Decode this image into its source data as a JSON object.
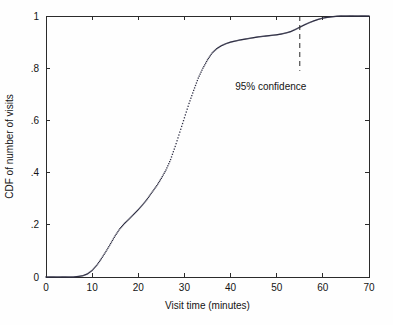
{
  "chart_data": {
    "type": "line",
    "render_style": "dotted-markers",
    "title": "",
    "subtitle": "",
    "xlabel": "Visit time (minutes)",
    "ylabel": "CDF of number of visits",
    "xlim": [
      0,
      70
    ],
    "ylim": [
      0,
      1
    ],
    "grid": false,
    "legend": null,
    "legend_position": "none",
    "xticks": [
      0,
      10,
      20,
      30,
      40,
      50,
      60,
      70
    ],
    "xtick_labels": [
      "0",
      "10",
      "20",
      "30",
      "40",
      "50",
      "60",
      "70"
    ],
    "yticks": [
      0,
      0.2,
      0.4,
      0.6,
      0.8,
      1
    ],
    "ytick_labels": [
      "0",
      ".2",
      ".4",
      ".6",
      ".8",
      "1"
    ],
    "series": [
      {
        "name": "CDF of number of visits",
        "x": [
          0,
          1,
          2,
          3,
          4,
          5,
          6,
          7,
          8,
          9,
          10,
          11,
          12,
          13,
          14,
          15,
          16,
          17,
          18,
          19,
          20,
          21,
          22,
          23,
          24,
          25,
          26,
          27,
          28,
          29,
          30,
          31,
          32,
          33,
          34,
          35,
          36,
          37,
          38,
          39,
          40,
          41,
          42,
          43,
          44,
          45,
          46,
          47,
          48,
          49,
          50,
          51,
          52,
          53,
          54,
          55,
          56,
          57,
          58,
          59,
          60,
          61,
          62,
          63,
          64,
          65,
          66,
          67,
          68,
          69,
          70
        ],
        "y": [
          0.0,
          0.0,
          0.0,
          0.0,
          0.0,
          0.0,
          0.0,
          0.002,
          0.005,
          0.012,
          0.025,
          0.045,
          0.07,
          0.098,
          0.128,
          0.158,
          0.185,
          0.205,
          0.222,
          0.24,
          0.258,
          0.278,
          0.3,
          0.325,
          0.35,
          0.378,
          0.41,
          0.45,
          0.5,
          0.555,
          0.61,
          0.665,
          0.715,
          0.762,
          0.8,
          0.832,
          0.858,
          0.875,
          0.886,
          0.894,
          0.9,
          0.904,
          0.908,
          0.911,
          0.914,
          0.917,
          0.92,
          0.922,
          0.924,
          0.926,
          0.928,
          0.931,
          0.935,
          0.94,
          0.948,
          0.957,
          0.966,
          0.974,
          0.981,
          0.987,
          0.992,
          0.995,
          0.997,
          0.999,
          1.0,
          1.0,
          1.0,
          1.0,
          1.0,
          1.0,
          1.0
        ]
      }
    ],
    "annotations": [
      {
        "label": "95% confidence",
        "type": "vertical-dashed-line-with-label",
        "x": 55,
        "y_top": 1.0,
        "y_bottom": 0.79,
        "text_x": 41,
        "text_y": 0.715
      }
    ]
  },
  "axes": {
    "x_title": "Visit time (minutes)",
    "y_title": "CDF of number of visits"
  },
  "colors": {
    "marker": "#2f2f44",
    "axis": "#2b2b2b",
    "text": "#141414",
    "background": "#fefefe",
    "confidence_line": "#272727"
  }
}
